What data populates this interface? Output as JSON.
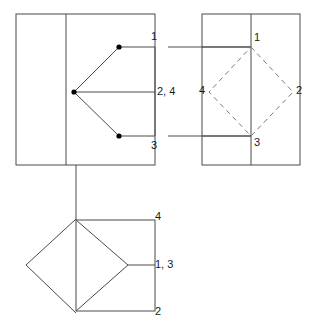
{
  "drawing": {
    "type": "orthographic-projection",
    "background_color": "#ffffff",
    "line_color": "#4a4a4a",
    "dashed_color": "#7a7a7a",
    "point_color": "#000000",
    "label_color": "#1a1a1a",
    "views": {
      "front": {
        "name": "front-view",
        "outer_rect": {
          "x": 16,
          "y": 14,
          "width": 139,
          "height": 151
        },
        "interior_vertical_line": {
          "x": 66,
          "y1": 14,
          "y2": 165
        },
        "point_labels": [
          {
            "id": "p1",
            "text": "1",
            "x": 151,
            "y": 31
          },
          {
            "id": "p24",
            "text": "2, 4",
            "x": 157,
            "y": 86
          },
          {
            "id": "p3",
            "text": "3",
            "x": 151,
            "y": 140
          }
        ],
        "vertices": [
          {
            "id": "v1",
            "x": 119,
            "y": 47
          },
          {
            "id": "v24",
            "x": 74,
            "y": 92
          },
          {
            "id": "v3",
            "x": 119,
            "y": 136
          }
        ]
      },
      "side": {
        "name": "side-view",
        "outer_rect": {
          "x": 202,
          "y": 14,
          "width": 98,
          "height": 151
        },
        "interior_vertical_line": {
          "x": 251,
          "y1": 14,
          "y2": 165
        },
        "diamond_vertices": [
          {
            "id": "d1",
            "label": "1",
            "x": 251,
            "y": 47
          },
          {
            "id": "d2",
            "label": "2",
            "x": 293,
            "y": 92
          },
          {
            "id": "d3",
            "label": "3",
            "x": 251,
            "y": 136
          },
          {
            "id": "d4",
            "label": "4",
            "x": 209,
            "y": 92
          }
        ],
        "point_labels": [
          {
            "id": "s1",
            "text": "1",
            "x": 254,
            "y": 38
          },
          {
            "id": "s2",
            "text": "2",
            "x": 296,
            "y": 84
          },
          {
            "id": "s3",
            "text": "3",
            "x": 254,
            "y": 138
          },
          {
            "id": "s4",
            "text": "4",
            "x": 200,
            "y": 84
          }
        ]
      },
      "top": {
        "name": "top-view",
        "square": {
          "x": 76,
          "y": 220,
          "width": 79,
          "height": 91
        },
        "diamond_vertices": [
          {
            "x": 76,
            "y": 219
          },
          {
            "x": 26,
            "y": 265
          },
          {
            "x": 76,
            "y": 313
          }
        ],
        "apex": {
          "x": 128,
          "y": 265
        },
        "projection_line": {
          "x": 76,
          "y1": 165,
          "y2": 220
        },
        "point_labels": [
          {
            "id": "t4",
            "text": "4",
            "x": 157,
            "y": 210
          },
          {
            "id": "t13",
            "text": "1, 3",
            "x": 157,
            "y": 259
          },
          {
            "id": "t2",
            "text": "2",
            "x": 157,
            "y": 306
          }
        ]
      }
    },
    "projection_lines": [
      {
        "id": "proj-1",
        "from_x": 119,
        "from_y": 47,
        "to_x": 251,
        "to_y": 47
      },
      {
        "id": "proj-3",
        "from_x": 119,
        "from_y": 136,
        "to_x": 251,
        "to_y": 136
      }
    ]
  }
}
